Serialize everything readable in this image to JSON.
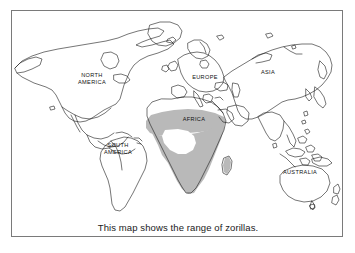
{
  "figure": {
    "type": "world-map-range-diagram",
    "caption": "This map shows the range of zorillas.",
    "subject": "zorillas",
    "border_color": "#7a7a7a",
    "background_color": "#ffffff",
    "coastline_color": "#1a1a1a",
    "range_shade_color": "#b9b9b9"
  },
  "map": {
    "labels": [
      {
        "id": "north-america",
        "text": "NORTH\nAMERICA"
      },
      {
        "id": "south-america",
        "text": "SOUTH\nAMERICA"
      },
      {
        "id": "europe",
        "text": "EUROPE"
      },
      {
        "id": "africa",
        "text": "AFRICA"
      },
      {
        "id": "asia",
        "text": "ASIA"
      },
      {
        "id": "australia",
        "text": "AUSTRALIA"
      }
    ],
    "range": {
      "region": "AFRICA",
      "description": "Shaded gray band across sub-Saharan Africa, excluding the Congo basin",
      "shade_color": "#b9b9b9"
    }
  }
}
